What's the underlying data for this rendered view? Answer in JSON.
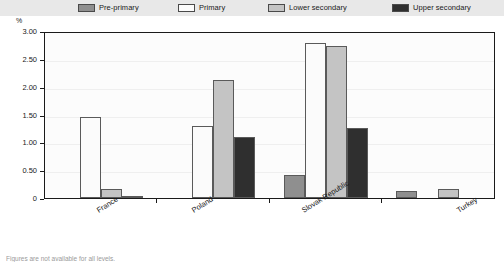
{
  "unit_label": "%",
  "legend": {
    "items": [
      {
        "label": "Pre-primary",
        "color": "#8f8f8f"
      },
      {
        "label": "Primary",
        "color": "#fbfbfb"
      },
      {
        "label": "Lower secondary",
        "color": "#c4c4c4"
      },
      {
        "label": "Upper secondary",
        "color": "#2f2f2f"
      }
    ]
  },
  "footnote": "Figures are not available for all levels.",
  "chart_data": {
    "type": "bar",
    "title": "",
    "subtitle": "",
    "xlabel": "",
    "ylabel": "%",
    "categories": [
      "France",
      "Poland",
      "Slovak Republic",
      "Turkey"
    ],
    "ylim": [
      0,
      3.0
    ],
    "ytick_labels": [
      "0",
      "0.50",
      "1.00",
      "1.50",
      "2.00",
      "2.50",
      "3.00"
    ],
    "ytick_values": [
      0,
      0.5,
      1.0,
      1.5,
      2.0,
      2.5,
      3.0
    ],
    "grid": true,
    "legend_position": "top",
    "series": [
      {
        "name": "Pre-primary",
        "color": "#8f8f8f",
        "values": [
          null,
          null,
          0.42,
          0.12
        ]
      },
      {
        "name": "Primary",
        "color": "#fbfbfb",
        "values": [
          1.45,
          1.3,
          2.78,
          null
        ]
      },
      {
        "name": "Lower secondary",
        "color": "#c4c4c4",
        "values": [
          0.17,
          2.12,
          2.73,
          0.17
        ]
      },
      {
        "name": "Upper secondary",
        "color": "#2f2f2f",
        "values": [
          0.02,
          1.1,
          1.25,
          null
        ]
      }
    ]
  }
}
